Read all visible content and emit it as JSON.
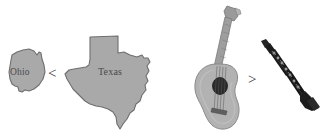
{
  "scene": {
    "background_color": "#ffffff",
    "width": 324,
    "height": 139
  },
  "comparisons": [
    {
      "id": "states",
      "left_item": "Ohio",
      "operator": "<",
      "right_item": "Texas",
      "operator_name": "less-than-symbol"
    },
    {
      "id": "instruments",
      "left_item": "guitar",
      "operator": ">",
      "right_item": "clarinet",
      "operator_name": "greater-than-symbol"
    }
  ],
  "labels": {
    "ohio": "Ohio",
    "texas": "Texas"
  },
  "symbols": {
    "less_than": "<",
    "greater_than": ">"
  },
  "figures": {
    "ohio": {
      "name": "ohio-state-shape",
      "fill": "#a9a9a9",
      "stroke": "#6e6e6e"
    },
    "texas": {
      "name": "texas-state-shape",
      "fill": "#a9a9a9",
      "stroke": "#6e6e6e"
    },
    "guitar": {
      "name": "acoustic-guitar",
      "body_fill": "#b0b0b0",
      "neck_fill": "#9a9a9a",
      "soundhole_fill": "#2b2b2b"
    },
    "clarinet": {
      "name": "clarinet",
      "body_fill": "#1c1c1c",
      "key_fill": "#8c8c8c"
    }
  }
}
